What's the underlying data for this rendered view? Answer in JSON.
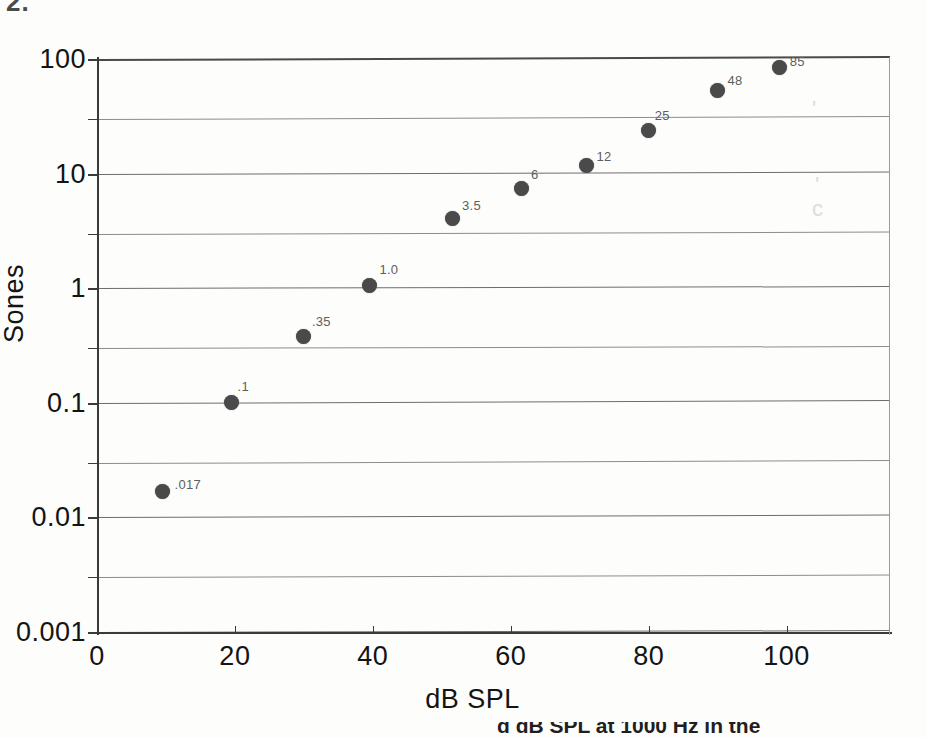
{
  "page": {
    "top_stray_text": "2.",
    "bottom_caption": "d dB SPL at 1000 Hz in the"
  },
  "chart_data": {
    "type": "scatter",
    "title": "",
    "xlabel": "dB SPL",
    "ylabel": "Sones",
    "xlim": [
      0,
      115
    ],
    "ylim": [
      0.001,
      100
    ],
    "yscale": "log",
    "xscale": "linear",
    "grid": true,
    "legend": "none",
    "x_ticks": [
      "0",
      "20",
      "40",
      "60",
      "80",
      "100"
    ],
    "x_tick_values": [
      0,
      20,
      40,
      60,
      80,
      100
    ],
    "y_ticks": [
      "100",
      "10",
      "1",
      "0.1",
      "0.01",
      "0.001"
    ],
    "y_tick_values": [
      100,
      10,
      1,
      0.1,
      0.01,
      0.001
    ],
    "y_minor_gridlines": [
      30,
      3,
      0.3,
      0.03,
      0.003
    ],
    "x": [
      9.5,
      19.5,
      30,
      39.5,
      51.5,
      61.5,
      71,
      80,
      90,
      99
    ],
    "y": [
      0.017,
      0.1,
      0.38,
      1.05,
      4.1,
      7.4,
      11.8,
      24,
      53,
      84
    ],
    "point_labels": [
      ".017",
      ".1",
      ".35",
      "1.0",
      "3.5",
      "6",
      "12",
      "25",
      "48",
      "85"
    ],
    "marker_color": "#4a4a4a",
    "gridline_color": "#8d8d8d",
    "axis_color": "#3a3a3a",
    "annotations": []
  },
  "artifacts": {
    "ghosts": [
      "'",
      "'",
      "c"
    ]
  }
}
